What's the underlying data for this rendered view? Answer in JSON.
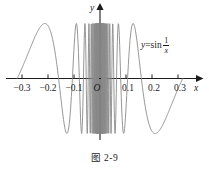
{
  "figure": {
    "caption": "图 2-9",
    "function_label": {
      "lhs": "y",
      "equals": "=",
      "op": "sin",
      "numerator": "1",
      "denominator": "x"
    },
    "origin_label": "O",
    "x_axis_name": "x",
    "y_axis_name": "y"
  },
  "chart_data": {
    "type": "line",
    "title": "",
    "subtitle": "",
    "xlabel": "x",
    "ylabel": "y",
    "expression": "y = sin(1/x)",
    "xlim": [
      -0.33,
      0.33
    ],
    "ylim": [
      -1.15,
      1.15
    ],
    "xticks": [
      -0.3,
      -0.2,
      -0.1,
      0.1,
      0.2,
      0.3
    ],
    "xtick_labels": [
      "−0.3",
      "−0.2",
      "−0.1",
      "0.1",
      "0.2",
      "0.3"
    ],
    "yticks": [],
    "ytick_labels": [],
    "grid": false,
    "legend": false,
    "legend_position": "none",
    "curve_color": "#8a8a8a",
    "axis_color": "#1c1c1c",
    "annotations": [
      {
        "text": "y=sin 1/x",
        "x": 0.18,
        "y": 0.72
      },
      {
        "text": "O",
        "x": 0.0,
        "y": -0.12
      }
    ],
    "series": [
      {
        "name": "sin(1/x)",
        "x_domain": [
          -0.318,
          0.318
        ],
        "excluded": [
          0
        ],
        "amplitude": 1,
        "zeros_positive": [
          0.3183,
          0.1592,
          0.1061,
          0.0796,
          0.0637,
          0.0531,
          0.0455,
          0.0398,
          0.0354,
          0.0318
        ],
        "maxima_positive": [
          0.2122,
          0.1273,
          0.0909,
          0.0707,
          0.0578,
          0.0489,
          0.0424,
          0.0374
        ],
        "minima_positive": [
          0.6366,
          0.1061,
          0.0735,
          0.0562,
          0.0455,
          0.0382,
          0.033
        ],
        "values": [
          1,
          0,
          -1,
          0,
          1,
          0,
          -1,
          0,
          1,
          0,
          -1
        ]
      }
    ]
  }
}
